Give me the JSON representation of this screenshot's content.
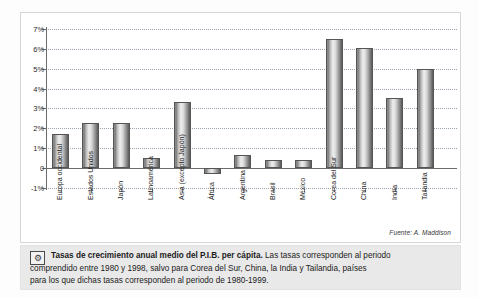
{
  "chart_data": {
    "type": "bar",
    "title": "",
    "xlabel": "",
    "ylabel": "",
    "ylim": [
      -1,
      7
    ],
    "grid": true,
    "legend": null,
    "ytick_labels": [
      "7%",
      "6%",
      "5%",
      "4%",
      "3%",
      "2%",
      "1%",
      "0",
      "-1%"
    ],
    "ytick_values": [
      7,
      6,
      5,
      4,
      3,
      2,
      1,
      0,
      -1
    ],
    "categories": [
      "Europa occidental",
      "Estados Unidos",
      "Japón",
      "Latinoamérica",
      "Asia (excepto Japón)",
      "África",
      "Argentina",
      "Brasil",
      "México",
      "Corea del Sur",
      "China",
      "India",
      "Tailandia"
    ],
    "values": [
      1.7,
      2.25,
      2.25,
      0.5,
      3.35,
      -0.3,
      0.65,
      0.4,
      0.4,
      6.5,
      6.05,
      3.55,
      5.0
    ],
    "source_note": "Fuente: A. Maddison",
    "units": "percent"
  },
  "caption": {
    "icon": "tools-icon",
    "bold_lead": "Tasas de crecimiento anual medio del P.I.B. per cápita.",
    "rest_line1": " Las tasas corresponden al periodo",
    "line2": "comprendido entre 1980 y 1998, salvo para Corea del Sur, China, la India y Tailandia, países",
    "line3": "para los que dichas tasas corresponden al periodo de 1980-1999."
  },
  "colors": {
    "page_background": "#fdfdfd",
    "panel_background": "#ffffff",
    "panel_border": "#d6d6d6",
    "grid_line": "#9aa4b0",
    "axis": "#6b6b6b",
    "bar_dark": "#5a5a5a",
    "bar_light": "#efefef",
    "caption_band": "#e9e9e9",
    "text": "#1b1b1b"
  }
}
